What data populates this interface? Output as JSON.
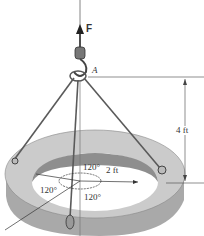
{
  "figure": {
    "force_label": "F",
    "point_label": "A",
    "height_dim": "4 ft",
    "radius_dim": "2 ft",
    "angles": [
      "120°",
      "120°",
      "120°"
    ]
  },
  "colors": {
    "ring_top": "#c9c9c9",
    "ring_side": "#a9a9a9",
    "ring_inner": "#8e8e8e",
    "cable": "#5a5a5a",
    "line": "#444444"
  }
}
